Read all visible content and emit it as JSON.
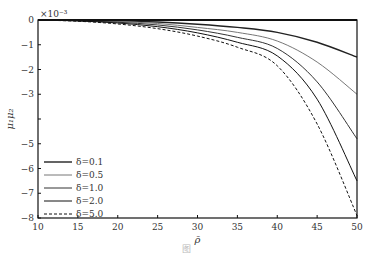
{
  "chart_data": {
    "type": "line",
    "title": "",
    "xlabel": "ρ̄",
    "ylabel": "μ₁μ₂",
    "y_multiplier": "×10⁻³",
    "xlim": [
      10,
      50
    ],
    "ylim": [
      -8,
      0
    ],
    "xticks": [
      10,
      15,
      20,
      25,
      30,
      35,
      40,
      45,
      50
    ],
    "yticks": [
      0,
      -1,
      -2,
      -3,
      -4,
      -5,
      -6,
      -7,
      -8
    ],
    "grid": false,
    "legend_position": "lower left",
    "x": [
      10,
      15,
      20,
      25,
      30,
      35,
      40,
      45,
      50
    ],
    "series": [
      {
        "name": "δ=0.1",
        "style": "solid",
        "color": "#222222",
        "width": 1.4,
        "values": [
          0,
          -0.01,
          -0.03,
          -0.08,
          -0.17,
          -0.3,
          -0.5,
          -0.9,
          -1.5
        ]
      },
      {
        "name": "δ=0.5",
        "style": "solid",
        "color": "#777777",
        "width": 1.0,
        "values": [
          0,
          -0.02,
          -0.06,
          -0.14,
          -0.3,
          -0.5,
          -0.85,
          -1.7,
          -3.0
        ]
      },
      {
        "name": "δ=1.0",
        "style": "solid",
        "color": "#333333",
        "width": 1.0,
        "values": [
          0,
          -0.03,
          -0.09,
          -0.2,
          -0.4,
          -0.7,
          -1.15,
          -2.5,
          -4.8
        ]
      },
      {
        "name": "δ=2.0",
        "style": "solid",
        "color": "#111111",
        "width": 1.0,
        "values": [
          0,
          -0.04,
          -0.12,
          -0.27,
          -0.52,
          -0.9,
          -1.45,
          -3.2,
          -6.5
        ]
      },
      {
        "name": "δ=5.0",
        "style": "dashed",
        "color": "#111111",
        "width": 1.0,
        "values": [
          0,
          -0.05,
          -0.16,
          -0.35,
          -0.65,
          -1.1,
          -1.85,
          -4.2,
          -7.9
        ]
      }
    ]
  },
  "caption": "图"
}
